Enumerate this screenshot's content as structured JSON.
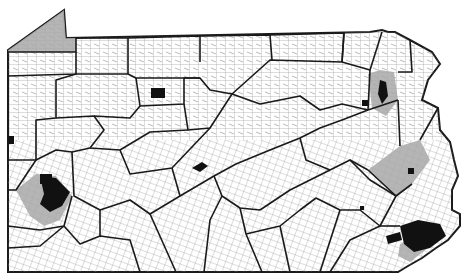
{
  "map": {
    "region": "Pennsylvania",
    "description": "Pennsylvania county and municipal boundary map with shaded counties and dark urban areas",
    "colors": {
      "background": "#ffffff",
      "county_border": "#1a1a1a",
      "municipal_border": "#666666",
      "shaded_county": "#a8a8a8",
      "urban_area": "#111111"
    },
    "shaded_counties": [
      "Erie",
      "Allegheny",
      "Lackawanna",
      "Lehigh",
      "Delaware"
    ],
    "dark_areas": [
      "Pittsburgh",
      "Philadelphia",
      "Scranton",
      "Allentown",
      "Elk County block",
      "Altoona"
    ]
  }
}
